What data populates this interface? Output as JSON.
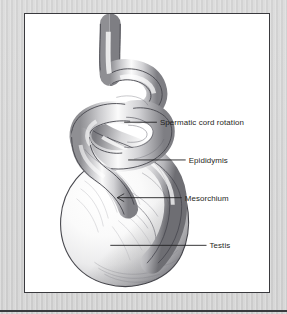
{
  "figure": {
    "frame": {
      "border_color": "#3a3a3e",
      "background_color": "#ffffff"
    },
    "page_background_color": "#d4d4d4",
    "rule_color": "#3a3a3e",
    "labels": [
      {
        "id": "spermatic-cord-rotation",
        "text": "Spermatic cord rotation",
        "leader_start": {
          "x": 124,
          "y": 122
        },
        "leader_end": {
          "x": 157,
          "y": 122
        },
        "text_x": 160,
        "text_y": 125
      },
      {
        "id": "epididymis",
        "text": "Epididymis",
        "leader_start": {
          "x": 128,
          "y": 160
        },
        "leader_end": {
          "x": 186,
          "y": 160
        },
        "text_x": 189,
        "text_y": 163
      },
      {
        "id": "mesorchium",
        "text": "Mesorchium",
        "leader_start": {
          "x": 117,
          "y": 198
        },
        "leader_end": {
          "x": 182,
          "y": 198
        },
        "text_x": 185,
        "text_y": 201
      },
      {
        "id": "testis",
        "text": "Testis",
        "leader_start": {
          "x": 110,
          "y": 246
        },
        "leader_end": {
          "x": 207,
          "y": 246
        },
        "text_x": 210,
        "text_y": 249
      }
    ],
    "anatomy": {
      "spermatic_cord": "twisted helical cord descending from top of frame",
      "epididymis": "coiled tube along posterior testis",
      "mesorchium": "fold attaching epididymis to testis",
      "testis": "large ovoid body with vascular striations"
    }
  }
}
